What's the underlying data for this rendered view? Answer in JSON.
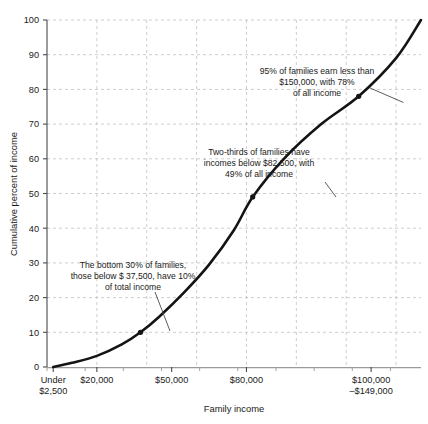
{
  "chart_data": {
    "type": "line",
    "title": "",
    "subtitle": "",
    "xlabel": "Family income",
    "ylabel": "Cumulative percent of income",
    "xlim": [
      0,
      150000
    ],
    "ylim": [
      0,
      100
    ],
    "grid": true,
    "legend": false,
    "y_ticks": [
      0,
      10,
      20,
      30,
      40,
      50,
      60,
      70,
      80,
      90,
      100
    ],
    "y_tick_labels": [
      "0",
      "10",
      "20",
      "30",
      "40",
      "50",
      "60",
      "70",
      "80",
      "90",
      "100"
    ],
    "x_tick_labels": [
      {
        "value": 2500,
        "line1": "Under",
        "line2": "$2,500"
      },
      {
        "value": 20000,
        "line1": "$20,000",
        "line2": ""
      },
      {
        "value": 50000,
        "line1": "$50,000",
        "line2": ""
      },
      {
        "value": 80000,
        "line1": "$80,000",
        "line2": ""
      },
      {
        "value": 130000,
        "line1": "$100,000",
        "line2": "–$149,000"
      }
    ],
    "series": [
      {
        "name": "Cumulative percent of income",
        "x": [
          2500,
          10000,
          20000,
          30000,
          37500,
          45000,
          55000,
          65000,
          75000,
          82500,
          95000,
          110000,
          125000,
          140000,
          150000
        ],
        "y": [
          0,
          1.2,
          3.2,
          6.5,
          10,
          14.5,
          21.5,
          29.5,
          39.5,
          49,
          60,
          70,
          78,
          89,
          100
        ]
      }
    ],
    "markers": [
      {
        "label": "bottom-30-percent",
        "x": 37500,
        "y": 10
      },
      {
        "label": "two-thirds-families",
        "x": 82500,
        "y": 49
      },
      {
        "label": "95-percent-families",
        "x": 125000,
        "y": 78
      }
    ],
    "annotations": [
      {
        "name": "annotation-95-percent",
        "lines": [
          "95% of families earn less than",
          "$150,000, with 78%",
          "of all income"
        ],
        "target_x": 125000,
        "target_y": 78
      },
      {
        "name": "annotation-two-thirds",
        "lines": [
          "Two-thirds of families have",
          "incomes below $82,500, with",
          "49% of all income"
        ],
        "target_x": 82500,
        "target_y": 49
      },
      {
        "name": "annotation-bottom-30",
        "lines": [
          "The bottom 30% of families,",
          "those below $ 37,500, have 10%",
          "of total income"
        ],
        "target_x": 37500,
        "target_y": 10
      }
    ],
    "colors": {
      "curve": "#141414",
      "grid": "#b8b8b8",
      "axis": "#4a4a4a",
      "text": "#1a1a1a",
      "background": "#ffffff"
    }
  }
}
